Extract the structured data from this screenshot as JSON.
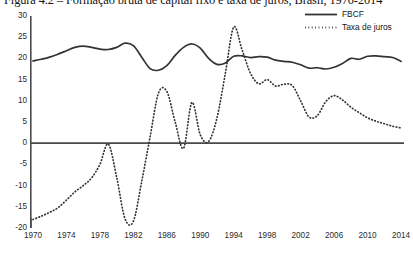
{
  "figure": {
    "caption": "Figura 4.2 – Formação bruta de capital fixo e taxa de juros, Brasil, 1970-2014"
  },
  "legend": {
    "position": "top-right",
    "items": [
      {
        "label": "FBCF",
        "style": "solid",
        "color": "#333333"
      },
      {
        "label": "Taxa de juros",
        "style": "dotted",
        "color": "#333333"
      }
    ]
  },
  "axes": {
    "y_ticks": [
      "30",
      "25",
      "20",
      "15",
      "10",
      "5",
      "0",
      "-5",
      "-10",
      "-15",
      "-20"
    ],
    "x_ticks": [
      "1970",
      "1974",
      "1978",
      "1982",
      "1986",
      "1990",
      "1994",
      "1998",
      "2002",
      "2006",
      "2010",
      "2014"
    ]
  },
  "chart_data": {
    "type": "line",
    "title": "Figura 4.2 – Formação bruta de capital fixo e taxa de juros, Brasil, 1970-2014",
    "xlabel": "",
    "ylabel": "",
    "xlim": [
      1970,
      2014
    ],
    "ylim": [
      -20,
      30
    ],
    "ytick_step": 5,
    "xtick_step": 4,
    "grid": false,
    "zero_line": true,
    "legend_position": "top-right",
    "x": [
      1970,
      1971,
      1972,
      1973,
      1974,
      1975,
      1976,
      1977,
      1978,
      1979,
      1980,
      1981,
      1982,
      1983,
      1984,
      1985,
      1986,
      1987,
      1988,
      1989,
      1990,
      1991,
      1992,
      1993,
      1994,
      1995,
      1996,
      1997,
      1998,
      1999,
      2000,
      2001,
      2002,
      2003,
      2004,
      2005,
      2006,
      2007,
      2008,
      2009,
      2010,
      2011,
      2012,
      2013,
      2014
    ],
    "series": [
      {
        "name": "FBCF",
        "style": "solid",
        "color": "#333333",
        "values": [
          19.4,
          19.8,
          20.3,
          21.0,
          21.8,
          22.6,
          22.9,
          22.6,
          22.2,
          22.1,
          22.6,
          23.6,
          23.0,
          20.3,
          17.6,
          17.2,
          18.3,
          20.7,
          22.6,
          23.4,
          22.4,
          20.0,
          18.6,
          18.9,
          20.5,
          20.6,
          20.2,
          20.4,
          20.3,
          19.6,
          19.3,
          19.1,
          18.5,
          17.7,
          17.8,
          17.5,
          17.9,
          18.8,
          20.0,
          19.8,
          20.5,
          20.6,
          20.4,
          20.2,
          19.3
        ]
      },
      {
        "name": "Taxa de juros",
        "style": "dotted",
        "color": "#333333",
        "values": [
          -18.0,
          -17.2,
          -16.3,
          -15.2,
          -13.4,
          -11.5,
          -10.0,
          -8.2,
          -5.0,
          -0.2,
          -8.0,
          -17.8,
          -18.4,
          -9.0,
          1.5,
          11.8,
          12.2,
          5.0,
          -1.2,
          9.6,
          2.0,
          0.4,
          6.0,
          16.5,
          27.4,
          22.0,
          16.5,
          14.0,
          15.0,
          13.5,
          13.9,
          13.6,
          10.0,
          6.2,
          6.5,
          9.8,
          11.2,
          10.2,
          8.5,
          7.2,
          6.0,
          5.2,
          4.6,
          4.0,
          3.6
        ]
      }
    ]
  }
}
